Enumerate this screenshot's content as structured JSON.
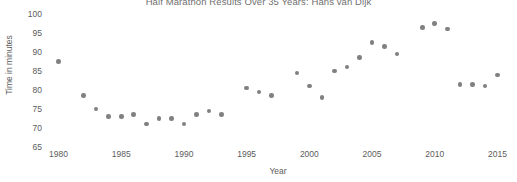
{
  "chart_data": {
    "type": "scatter",
    "title": "Half Marathon Results Over 35 Years: Hans van Dijk",
    "xlabel": "Year",
    "ylabel": "Time in minutes",
    "xlim": [
      1979,
      2016
    ],
    "ylim": [
      65,
      100
    ],
    "grid": false,
    "legend": "none",
    "marker_color": "#808080",
    "xticks": [
      1980,
      1985,
      1990,
      1995,
      2000,
      2005,
      2010,
      2015
    ],
    "yticks": [
      65,
      70,
      75,
      80,
      85,
      90,
      95,
      100
    ],
    "series": [
      {
        "name": "Finish time",
        "points": [
          {
            "x": 1980,
            "y": 87.5
          },
          {
            "x": 1982,
            "y": 78.5
          },
          {
            "x": 1983,
            "y": 75.0
          },
          {
            "x": 1984,
            "y": 73.0
          },
          {
            "x": 1985,
            "y": 73.0
          },
          {
            "x": 1986,
            "y": 73.5
          },
          {
            "x": 1987,
            "y": 71.0
          },
          {
            "x": 1988,
            "y": 72.5
          },
          {
            "x": 1989,
            "y": 72.5
          },
          {
            "x": 1990,
            "y": 71.0
          },
          {
            "x": 1991,
            "y": 73.5
          },
          {
            "x": 1992,
            "y": 74.5
          },
          {
            "x": 1993,
            "y": 73.5
          },
          {
            "x": 1995,
            "y": 80.5
          },
          {
            "x": 1996,
            "y": 79.5
          },
          {
            "x": 1997,
            "y": 78.5
          },
          {
            "x": 1999,
            "y": 84.5
          },
          {
            "x": 2000,
            "y": 81.0
          },
          {
            "x": 2001,
            "y": 78.0
          },
          {
            "x": 2002,
            "y": 85.0
          },
          {
            "x": 2003,
            "y": 86.0
          },
          {
            "x": 2004,
            "y": 88.5
          },
          {
            "x": 2005,
            "y": 92.5
          },
          {
            "x": 2006,
            "y": 91.5
          },
          {
            "x": 2007,
            "y": 89.5
          },
          {
            "x": 2009,
            "y": 96.5
          },
          {
            "x": 2010,
            "y": 97.5
          },
          {
            "x": 2011,
            "y": 96.0
          },
          {
            "x": 2012,
            "y": 81.5
          },
          {
            "x": 2013,
            "y": 81.5
          },
          {
            "x": 2014,
            "y": 81.0
          },
          {
            "x": 2015,
            "y": 84.0
          }
        ]
      }
    ]
  }
}
